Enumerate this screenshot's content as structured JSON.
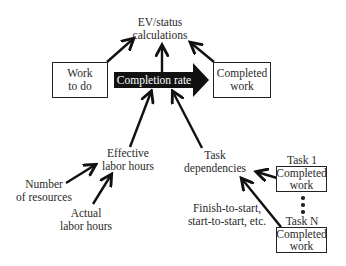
{
  "diagram": {
    "top_node": {
      "line1": "EV/status",
      "line2": "calculations"
    },
    "work_to_do": {
      "line1": "Work",
      "line2": "to do"
    },
    "completion_rate": {
      "label": "Completion rate"
    },
    "completed_work": {
      "line1": "Completed",
      "line2": "work"
    },
    "effective_labor_hours": {
      "line1": "Effective",
      "line2": "labor hours"
    },
    "number_of_resources": {
      "line1": "Number",
      "line2": "of resources"
    },
    "actual_labor_hours": {
      "line1": "Actual",
      "line2": "labor hours"
    },
    "task_dependencies": {
      "line1": "Task",
      "line2": "dependencies"
    },
    "dependency_types": {
      "line1": "Finish-to-start,",
      "line2": "start-to-start, etc."
    },
    "task_1": {
      "title": "Task 1",
      "line1": "Completed",
      "line2": "work"
    },
    "task_n": {
      "title": "Task N",
      "line1": "Completed",
      "line2": "work"
    },
    "ellipsis": "⋮",
    "colors": {
      "stroke": "#222222",
      "arrow_fill": "#111111",
      "background": "#ffffff"
    }
  }
}
